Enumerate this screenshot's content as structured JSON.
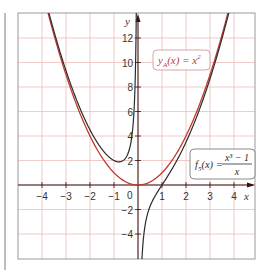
{
  "chart_data": {
    "type": "line",
    "title": "",
    "xlabel": "x",
    "ylabel": "y",
    "xlim": [
      -5,
      4.9
    ],
    "ylim": [
      -6,
      14
    ],
    "grid": true,
    "x_ticks": [
      -4,
      -3,
      -2,
      -1,
      1,
      2,
      3,
      4
    ],
    "x_tick_labels": [
      "−4",
      "−3",
      "−2",
      "−1",
      "1",
      "2",
      "3",
      "4"
    ],
    "y_ticks": [
      -4,
      -2,
      2,
      4,
      6,
      8,
      10,
      12
    ],
    "y_tick_labels": [
      "−4",
      "−2",
      "2",
      "4",
      "6",
      "8",
      "10",
      "12"
    ],
    "origin_label": "0",
    "series": [
      {
        "name": "y_A(x) = x^2",
        "label_text": "yA(x) = x²",
        "color": "#c0392b",
        "expression": "x^2",
        "x": [
          -3.6,
          -3,
          -2,
          -1.5,
          -1,
          -0.5,
          0,
          0.5,
          1,
          1.5,
          2,
          3,
          3.7
        ],
        "values": [
          12.96,
          9,
          4,
          2.25,
          1,
          0.25,
          0,
          0.25,
          1,
          2.25,
          4,
          9,
          13.69
        ]
      },
      {
        "name": "f_5(x) = (x^3 - 1)/x",
        "label_text": "f5(x) = (x³ − 1)/x",
        "color": "#2b2b2b",
        "expression": "(x^3-1)/x",
        "x": [
          -3.6,
          -3,
          -2,
          -1.5,
          -1,
          -0.79,
          -0.5,
          -0.2,
          -0.08,
          0.08,
          0.2,
          0.5,
          1,
          1.5,
          2,
          3,
          3.7
        ],
        "values": [
          13.24,
          9.33,
          4.5,
          2.92,
          2,
          1.89,
          2.25,
          5.04,
          12.5,
          -12.5,
          -4.96,
          -1.75,
          0,
          1.58,
          3.5,
          8.67,
          13.42
        ]
      }
    ],
    "legend_position": "inline labels",
    "annotations": [
      {
        "text": "yA(x) = x²",
        "x": 1.9,
        "y": 10
      },
      {
        "text": "f5(x) = (x³ − 1)/x",
        "x": 3.1,
        "y": 2
      }
    ]
  },
  "labels": {
    "axis_x": "x",
    "axis_y": "y",
    "origin": "0",
    "ya_label_prefix": "y",
    "ya_label_sub": "A",
    "ya_label_rest": "(x) = x",
    "ya_label_sup": "2",
    "f5_label_prefix": "f",
    "f5_label_sub": "5",
    "f5_label_rest": "(x) =",
    "f5_num": "x³ − 1",
    "f5_den": "x"
  },
  "colors": {
    "grid": "#e8b4b4",
    "axis": "#3a1010",
    "frame": "#9a9a9a",
    "red_curve": "#c0392b",
    "black_curve": "#2b2b2b",
    "side_bar": "#bdbdbd"
  }
}
